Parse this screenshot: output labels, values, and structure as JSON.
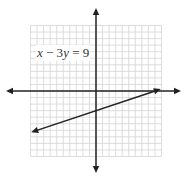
{
  "chart_data": {
    "type": "line",
    "title": "",
    "annotations": [
      "x − 3y = 9"
    ],
    "equation": "x - 3y = 9",
    "slope": 0.3333,
    "y_intercept": -3,
    "x_intercept": 9,
    "series": [
      {
        "name": "x - 3y = 9",
        "x": [
          -9.6,
          9.6
        ],
        "y": [
          -6.2,
          0.2
        ],
        "arrows": "both"
      }
    ],
    "xlim": [
      -10,
      10
    ],
    "ylim": [
      -10,
      10
    ],
    "grid": true,
    "grid_step": 1,
    "xlabel": "",
    "ylabel": "",
    "axes_arrows": true
  },
  "label": {
    "x": "x",
    "op": " − 3",
    "y": "y",
    "rhs": " = 9"
  },
  "colors": {
    "grid": "#d4d4d4",
    "axis": "#222222",
    "line": "#222222",
    "text": "#333333"
  }
}
